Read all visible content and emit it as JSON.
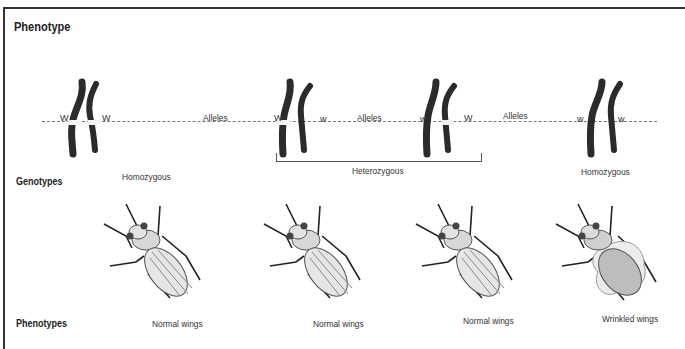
{
  "figure": {
    "title": "Phenotype",
    "row_labels": {
      "genotypes": "Genotypes",
      "phenotypes": "Phenotypes"
    },
    "allele_label": "Alleles",
    "pairs": [
      {
        "left_allele": "W",
        "right_allele": "W",
        "left_band": true,
        "right_band": true
      },
      {
        "left_allele": "W",
        "right_allele": "w",
        "left_band": true,
        "right_band": false
      },
      {
        "left_allele": "w",
        "right_allele": "W",
        "left_band": false,
        "right_band": true
      },
      {
        "left_allele": "w",
        "right_allele": "w",
        "left_band": false,
        "right_band": false
      }
    ],
    "genotypes": {
      "homozygous_left": "Homozygous",
      "heterozygous": "Heterozygous",
      "homozygous_right": "Homozygous"
    },
    "phenotypes": [
      "Normal wings",
      "Normal wings",
      "Normal wings",
      "Wrinkled wings"
    ],
    "colors": {
      "chromosome": "#2b2b2b",
      "band": "#f4f4f4",
      "line": "#777777",
      "fly_body": "#d8d8d8"
    }
  }
}
